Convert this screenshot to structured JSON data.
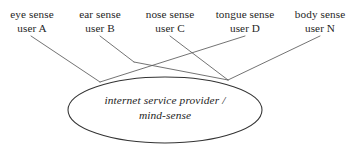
{
  "diagram": {
    "type": "sense-to-hub-mapping",
    "background_color": "#ffffff",
    "line_color": "#555555",
    "ellipse_stroke": "#333333",
    "sense_labels": [
      {
        "id": "eye",
        "sense": "eye sense",
        "user": "user A"
      },
      {
        "id": "ear",
        "sense": "ear sense",
        "user": "user B"
      },
      {
        "id": "nose",
        "sense": "nose sense",
        "user": "user C"
      },
      {
        "id": "tongue",
        "sense": "tongue sense",
        "user": "user D"
      },
      {
        "id": "body",
        "sense": "body sense",
        "user": "user N"
      }
    ],
    "hub": {
      "line1": "internet service provider /",
      "line2": "mind-sense"
    }
  }
}
